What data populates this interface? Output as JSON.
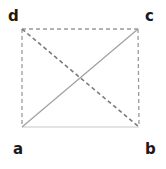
{
  "diagram": {
    "type": "rectangle-with-diagonals",
    "vertices": {
      "a": {
        "label": "a",
        "x": 22,
        "y": 127
      },
      "b": {
        "label": "b",
        "x": 139,
        "y": 127
      },
      "c": {
        "label": "c",
        "x": 138,
        "y": 29
      },
      "d": {
        "label": "d",
        "x": 22,
        "y": 29
      }
    },
    "edges": [
      {
        "from": "d",
        "to": "c",
        "style": "dashed",
        "color": "#9a9a9a"
      },
      {
        "from": "d",
        "to": "a",
        "style": "dashed",
        "color": "#9a9a9a"
      },
      {
        "from": "c",
        "to": "b",
        "style": "dashed",
        "color": "#9a9a9a"
      },
      {
        "from": "a",
        "to": "b",
        "style": "solid",
        "color": "#c8c8c8"
      },
      {
        "from": "a",
        "to": "c",
        "style": "solid",
        "color": "#a0a0a0"
      },
      {
        "from": "d",
        "to": "b",
        "style": "dashed",
        "color": "#7a7a7a"
      }
    ]
  }
}
